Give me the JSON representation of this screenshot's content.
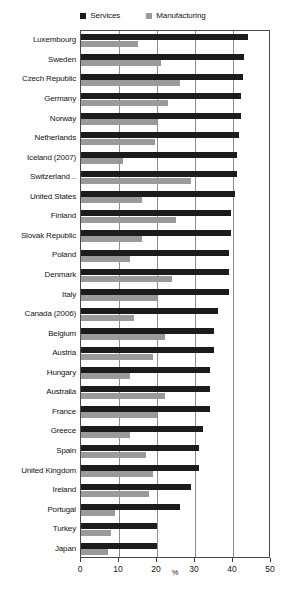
{
  "chart_data": {
    "type": "bar",
    "orientation": "horizontal",
    "title": "",
    "subtitle": "",
    "xlabel": "%",
    "ylabel": "",
    "xlim": [
      0,
      50
    ],
    "xticks": [
      0,
      10,
      20,
      30,
      40,
      50
    ],
    "grid": true,
    "legend_position": "top-center",
    "categories": [
      "Luxembourg",
      "Sweden",
      "Czech Republic",
      "Germany",
      "Norway",
      "Netherlands",
      "Iceland (2007)",
      "Switzerland ..",
      "United States",
      "Finland",
      "Slovak Republic",
      "Poland",
      "Denmark",
      "Italy",
      "Canada (2006)",
      "Belgium",
      "Austria",
      "Hungary",
      "Australia",
      "France",
      "Greece",
      "Spain",
      "United Kingdom",
      "Ireland",
      "Portugal",
      "Turkey",
      "Japan"
    ],
    "series": [
      {
        "name": "Services",
        "color": "#1c1c1c",
        "values": [
          44,
          43,
          42.5,
          42,
          42,
          41.5,
          41,
          41,
          40.5,
          39.5,
          39.5,
          39,
          39,
          39,
          36,
          35,
          35,
          34,
          34,
          34,
          32,
          31,
          31,
          29,
          26,
          20,
          20
        ]
      },
      {
        "name": "Manufacturing",
        "color": "#9a9a9a",
        "values": [
          15,
          21,
          26,
          23,
          20,
          19.5,
          11,
          29,
          16,
          25,
          16,
          13,
          24,
          20,
          14,
          22,
          19,
          13,
          22,
          20,
          13,
          17,
          19,
          18,
          9,
          8,
          7
        ]
      }
    ]
  },
  "legend": {
    "entries": [
      {
        "label": "Services",
        "color": "#1c1c1c"
      },
      {
        "label": "Manufacturing",
        "color": "#9a9a9a"
      }
    ]
  },
  "axis": {
    "tick_labels": [
      "0",
      "10",
      "20",
      "30",
      "40",
      "50"
    ],
    "unit_label": "%"
  }
}
